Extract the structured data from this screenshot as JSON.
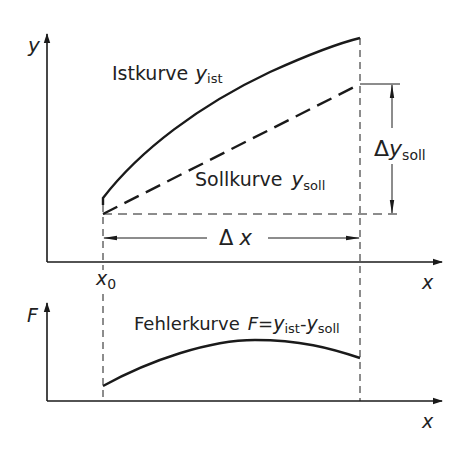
{
  "upper_plot": {
    "y_axis_label": "y",
    "x_axis_label": "x",
    "x0_label": "x",
    "x0_subscript": "0",
    "ist_curve": {
      "label": "Istkurve",
      "symbol": "y",
      "subscript": "ist",
      "style": "solid"
    },
    "soll_curve": {
      "label": "Sollkurve",
      "symbol": "y",
      "subscript": "soll",
      "style": "dashed"
    },
    "delta_y": {
      "delta": "Δ",
      "symbol": "y",
      "subscript": "soll"
    },
    "delta_x": {
      "delta": "Δ",
      "symbol": "x"
    }
  },
  "lower_plot": {
    "y_axis_label": "F",
    "x_axis_label": "x",
    "error_curve": {
      "label": "Fehlerkurve",
      "formula_F": "F",
      "formula_eq": "=",
      "formula_y1": "y",
      "formula_sub1": "ist",
      "formula_minus": "-",
      "formula_y2": "y",
      "formula_sub2": "soll"
    }
  },
  "colors": {
    "line": "#1a1a1a",
    "background": "#ffffff"
  }
}
